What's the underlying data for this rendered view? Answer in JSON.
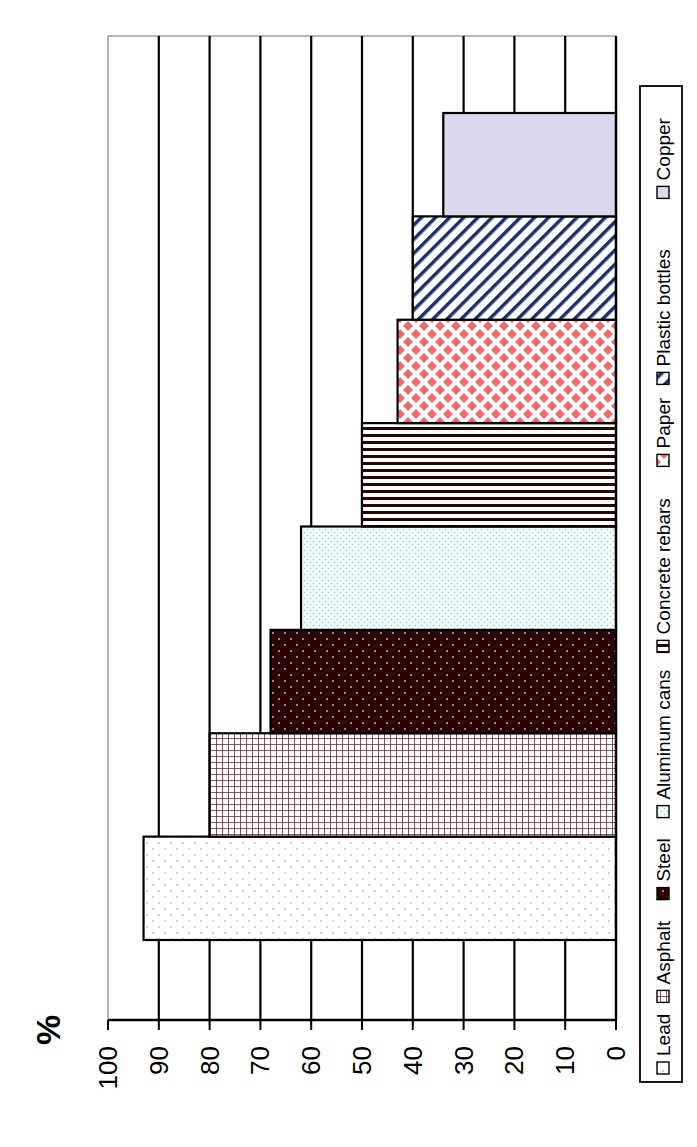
{
  "chart_data": {
    "type": "bar",
    "orientation": "horizontal bars in a chart rotated 90 degrees clockwise (value axis runs right-to-left across the page)",
    "title": "",
    "xlabel": "",
    "ylabel": "%",
    "ylim": [
      0,
      100
    ],
    "yticks": [
      "0",
      "10",
      "20",
      "30",
      "40",
      "50",
      "60",
      "70",
      "80",
      "90",
      "100"
    ],
    "grid": true,
    "legend_position": "bottom (right side of page when rotated)",
    "categories": [
      "Lead",
      "Asphalt",
      "Steel",
      "Aluminum cans",
      "Concrete rebars",
      "Paper",
      "Plastic bottles",
      "Copper"
    ],
    "values": [
      93,
      80,
      68,
      62,
      50,
      43,
      40,
      34
    ],
    "series": [
      {
        "name": "Lead",
        "value": 93,
        "fill": "#ffffff",
        "pattern": "sparse-dots",
        "pattern_color": "#bbbbbb"
      },
      {
        "name": "Asphalt",
        "value": 80,
        "fill": "#ffffff",
        "pattern": "grid",
        "pattern_color": "#7a1f2e"
      },
      {
        "name": "Steel",
        "value": 68,
        "fill": "#2a0505",
        "pattern": "dots",
        "pattern_color": "#d9a0a0"
      },
      {
        "name": "Aluminum cans",
        "value": 62,
        "fill": "#f2fbfb",
        "pattern": "fine-dots",
        "pattern_color": "#9fc4c9"
      },
      {
        "name": "Concrete rebars",
        "value": 50,
        "fill": "#ffffff",
        "pattern": "vertical-lines",
        "pattern_color": "#2a0505"
      },
      {
        "name": "Paper",
        "value": 43,
        "fill": "#ffffff",
        "pattern": "diamonds",
        "pattern_color": "#f06a6a"
      },
      {
        "name": "Plastic bottles",
        "value": 40,
        "fill": "#ffffff",
        "pattern": "diagonal-stripes",
        "pattern_color": "#1f2f6b"
      },
      {
        "name": "Copper",
        "value": 34,
        "fill": "#dcd8ee",
        "pattern": "solid",
        "pattern_color": "#dcd8ee"
      }
    ]
  },
  "legend": {
    "items": [
      "Lead",
      "Asphalt",
      "Steel",
      "Aluminum cans",
      "Concrete rebars",
      "Paper",
      "Plastic bottles",
      "Copper"
    ]
  },
  "axis": {
    "label": "%"
  }
}
